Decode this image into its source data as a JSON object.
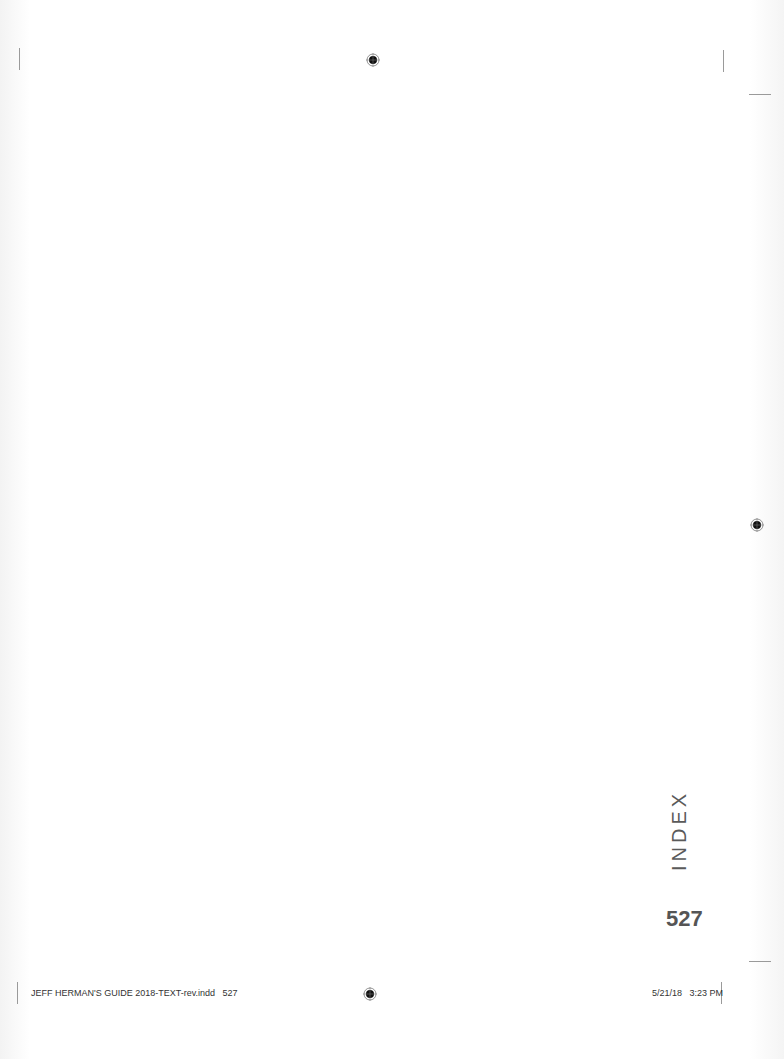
{
  "page": {
    "section_tab": "INDEX",
    "page_number": "527"
  },
  "slug": {
    "file_info": "JEFF HERMAN'S GUIDE 2018-TEXT-rev.indd   527",
    "timestamp": "5/21/18   3:23 PM"
  },
  "marks": {
    "registration_icon": "registration-target-icon",
    "crop_color": "#9a9a9a"
  }
}
